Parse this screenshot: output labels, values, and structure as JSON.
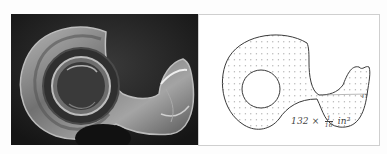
{
  "figure": {
    "photo": {
      "subject": "clear plastic tape dispenser with tape roll",
      "colors": {
        "background": "#1e1e1e",
        "plastic_highlight": "#d8d8d8",
        "tape_ring": "#3a3a3a"
      }
    },
    "drawing": {
      "subject": "hand-traced outline of tape dispenser on dot grid",
      "area_label": {
        "count": "132",
        "times": "×",
        "fraction_numerator": "1",
        "fraction_denominator": "16",
        "unit": "in²"
      },
      "edge_label": "47",
      "colors": {
        "stroke": "#3a3a3a",
        "dots": "#9a9a9a",
        "paper": "#ffffff",
        "border": "#cfcfcf"
      }
    }
  }
}
